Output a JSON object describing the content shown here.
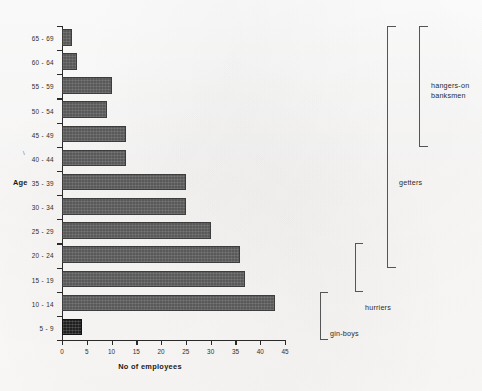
{
  "chart_data": {
    "type": "bar",
    "orientation": "horizontal",
    "title": "",
    "xlabel": "No of employees",
    "ylabel": "Age",
    "categories": [
      "65 - 69",
      "60 - 64",
      "55 - 59",
      "50 - 54",
      "45 - 49",
      "40 - 44",
      "35 - 39",
      "30 - 34",
      "25 - 29",
      "20 - 24",
      "15 - 19",
      "10 - 14",
      "5 - 9"
    ],
    "values": [
      2,
      3,
      10,
      9,
      13,
      13,
      25,
      25,
      30,
      36,
      37,
      43,
      4
    ],
    "xlim": [
      0,
      45
    ],
    "xticks": [
      0,
      5,
      10,
      15,
      20,
      25,
      30,
      35,
      40,
      45
    ],
    "xtick_labels": [
      "0",
      "5",
      "10",
      "15",
      "20",
      "25",
      "30",
      "35",
      "40",
      "45"
    ],
    "grid": false,
    "legend": "none",
    "bar_color": "#595959",
    "highlight_color": "#1f1f1f",
    "highlight_category": "5 - 9",
    "annotations": [
      {
        "id": "hangers-on-banksmen",
        "label": "hangers-on\nbanksmen",
        "covers": [
          "65 - 69",
          "60 - 64",
          "55 - 59",
          "50 - 54",
          "45 - 49"
        ]
      },
      {
        "id": "getters",
        "label": "getters",
        "covers": [
          "65 - 69",
          "60 - 64",
          "55 - 59",
          "50 - 54",
          "45 - 49",
          "40 - 44",
          "35 - 39",
          "30 - 34",
          "25 - 29",
          "20 - 24"
        ]
      },
      {
        "id": "hurriers",
        "label": "hurriers",
        "covers": [
          "20 - 24",
          "15 - 19"
        ]
      },
      {
        "id": "gin-boys",
        "label": "gin-boys",
        "covers": [
          "10 - 14",
          "5 - 9"
        ]
      }
    ]
  },
  "axes": {
    "y_title": "Age",
    "y_small_tick_glyph": "\\"
  }
}
